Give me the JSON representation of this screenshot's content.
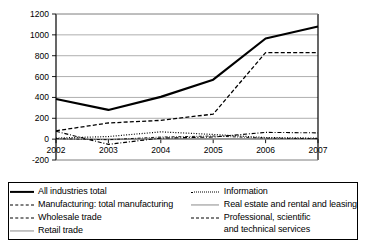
{
  "chart_data": {
    "type": "line",
    "title": "",
    "xlabel": "",
    "ylabel": "",
    "x": [
      "2002",
      "2003",
      "2004",
      "2005",
      "2006",
      "2007"
    ],
    "categories": [
      "2002",
      "2003",
      "2004",
      "2005",
      "2006",
      "2007"
    ],
    "ylim": [
      -200,
      1200
    ],
    "ytick_labels": [
      "1200",
      "1000",
      "800",
      "600",
      "400",
      "200",
      "0",
      "-200"
    ],
    "yticks": [
      1200,
      1000,
      800,
      600,
      400,
      200,
      0,
      -200
    ],
    "grid": true,
    "legend_position": "bottom",
    "series": [
      {
        "name": "All industries total",
        "style": "solid-thick",
        "color": "#000000",
        "values": [
          385,
          280,
          405,
          570,
          965,
          1080
        ]
      },
      {
        "name": "Manufacturing: total manufacturing",
        "style": "dash-dot-fine",
        "color": "#000000",
        "values": [
          5,
          -5,
          20,
          30,
          10,
          5
        ]
      },
      {
        "name": "Wholesale trade",
        "style": "dashed",
        "color": "#000000",
        "values": [
          80,
          155,
          180,
          240,
          830,
          830
        ]
      },
      {
        "name": "Retail trade",
        "style": "gray-solid",
        "color": "#8a8a8a",
        "values": [
          0,
          0,
          5,
          5,
          0,
          0
        ]
      },
      {
        "name": "Information",
        "style": "dotted",
        "color": "#000000",
        "values": [
          10,
          25,
          70,
          45,
          15,
          10
        ]
      },
      {
        "name": "Real estate and rental and leasing",
        "style": "gray-solid",
        "color": "#8a8a8a",
        "values": [
          0,
          -5,
          0,
          0,
          5,
          5
        ]
      },
      {
        "name": "Professional, scientific and technical services",
        "style": "dash-dot",
        "color": "#000000",
        "values": [
          75,
          -50,
          10,
          20,
          65,
          60
        ]
      }
    ]
  },
  "axis": {
    "y_labels": [
      "1200",
      "1000",
      "800",
      "600",
      "400",
      "200",
      "0",
      "-200"
    ],
    "x_labels": [
      "2002",
      "2003",
      "2004",
      "2005",
      "2006",
      "2007"
    ]
  },
  "legend": {
    "left": [
      {
        "label": "All industries total",
        "style": "solid-thick"
      },
      {
        "label": "Manufacturing: total manufacturing",
        "style": "dash-dot-fine"
      },
      {
        "label": "Wholesale trade",
        "style": "dashed"
      },
      {
        "label": "Retail trade",
        "style": "gray-solid"
      }
    ],
    "right": [
      {
        "label": "Information",
        "style": "dotted"
      },
      {
        "label": "Real estate and rental and leasing",
        "style": "gray-solid"
      },
      {
        "label_line1": "Professional, scientific",
        "label_line2": "and technical services",
        "style": "dash-dot"
      }
    ]
  }
}
